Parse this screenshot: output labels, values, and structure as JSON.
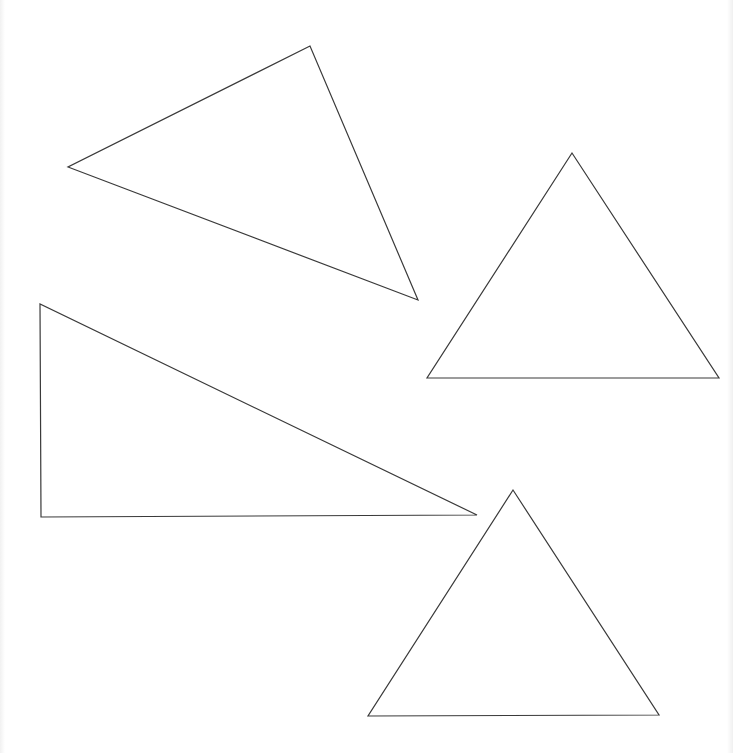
{
  "canvas": {
    "width": 733,
    "height": 753,
    "background": "#ffffff",
    "stroke_color": "#3a3a3a"
  },
  "shapes": [
    {
      "name": "triangle-scalene-top-left",
      "type": "triangle",
      "points": "310,46 68,167 418,300"
    },
    {
      "name": "triangle-upright-right",
      "type": "triangle",
      "points": "572,153 427,378 719,378"
    },
    {
      "name": "triangle-right-angle-left",
      "type": "triangle",
      "points": "40,304 41,517 477,515"
    },
    {
      "name": "triangle-upright-bottom",
      "type": "triangle",
      "points": "513,490 368,716 659,715"
    }
  ]
}
